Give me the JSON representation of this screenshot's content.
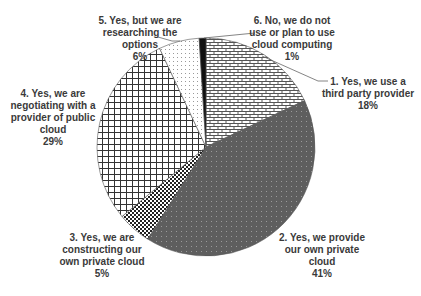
{
  "chart_data": {
    "type": "pie",
    "title": "",
    "start_angle_deg": 0,
    "direction": "clockwise",
    "slices": [
      {
        "label": "1. Yes, we use a third party provider",
        "value": 18,
        "display": "18%",
        "pattern": "brick"
      },
      {
        "label": "2. Yes, we provide our own private cloud",
        "value": 41,
        "display": "41%",
        "pattern": "dark-dots"
      },
      {
        "label": "3. Yes, we are constructing our own private cloud",
        "value": 5,
        "display": "5%",
        "pattern": "checker"
      },
      {
        "label": "4. Yes, we are negotiating with a provider of public cloud",
        "value": 29,
        "display": "29%",
        "pattern": "grid"
      },
      {
        "label": "5. Yes, but we are researching the options",
        "value": 6,
        "display": "6%",
        "pattern": "light-dots"
      },
      {
        "label": "6. No, we do not use or plan to use cloud computing",
        "value": 1,
        "display": "1%",
        "pattern": "solid-black"
      }
    ],
    "legend": "none (data labels with leader lines)"
  },
  "labels": {
    "s1": "1. Yes, we use a\nthird party provider\n18%",
    "s2": "2. Yes, we provide\nour own private\ncloud\n41%",
    "s3": "3. Yes, we are\nconstructing our\nown private cloud\n5%",
    "s4": "4. Yes, we are\nnegotiating with a\nprovider of public\ncloud\n29%",
    "s5": "5. Yes, but we are\nresearching the\noptions\n6%",
    "s6": "6. No, we do not\nuse or plan to use\ncloud computing\n1%"
  },
  "colors": {
    "outline": "#555555",
    "dark_fill": "#5e5e5e",
    "text": "#3a3a3a"
  }
}
